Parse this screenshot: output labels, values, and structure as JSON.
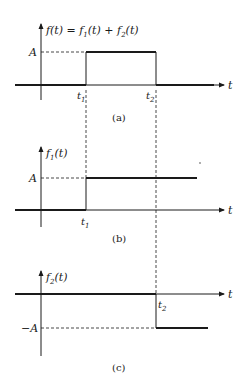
{
  "figure": {
    "panels": [
      {
        "id": "a",
        "caption": "(a)",
        "y_label": "f(t) = f",
        "y_label_parts": [
          "f(t) = f",
          "1",
          "(t) + f",
          "2",
          "(t)"
        ],
        "x_label": "t",
        "level_label": "A",
        "ticks": [
          {
            "name": "t",
            "sub": "1"
          },
          {
            "name": "t",
            "sub": "2"
          }
        ],
        "description": "Rectangular pulse of height A from t1 to t2"
      },
      {
        "id": "b",
        "caption": "(b)",
        "y_label_parts": [
          "f",
          "1",
          "(t)"
        ],
        "x_label": "t",
        "level_label": "A",
        "ticks": [
          {
            "name": "t",
            "sub": "1"
          }
        ],
        "description": "Step of height A starting at t1"
      },
      {
        "id": "c",
        "caption": "(c)",
        "y_label_parts": [
          "f",
          "2",
          "(t)"
        ],
        "x_label": "t",
        "level_label": "−A",
        "ticks": [
          {
            "name": "t",
            "sub": "2"
          }
        ],
        "description": "Step of height -A starting at t2"
      }
    ],
    "stroke_color": "#1a1a1a",
    "background": "#ffffff"
  }
}
